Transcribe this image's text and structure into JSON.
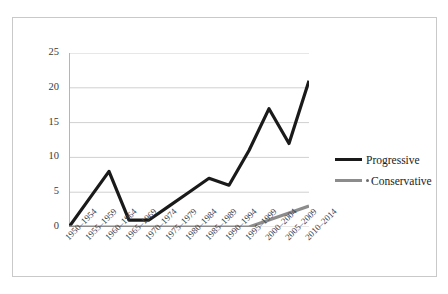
{
  "chart_data": {
    "type": "line",
    "title": "",
    "xlabel": "",
    "ylabel": "",
    "ylim": [
      0,
      25
    ],
    "yticks": [
      0,
      5,
      10,
      15,
      20,
      25
    ],
    "grid": "horizontal",
    "legend_position": "right",
    "categories": [
      "1950–1954",
      "1955–1959",
      "1960–1964",
      "1965–1969",
      "1970–1974",
      "1975–1979",
      "1980–1984",
      "1985–1989",
      "1990–1994",
      "1995–1999",
      "2000–2004",
      "2005–2009",
      "2010–2014"
    ],
    "series": [
      {
        "name": "Progressive",
        "color": "#1a1a1a",
        "style": "solid",
        "values": [
          0,
          4,
          8,
          1,
          1,
          3,
          5,
          7,
          6,
          11,
          17,
          12,
          21
        ]
      },
      {
        "name": "Conservative",
        "color": "#8c8c8c",
        "style": "solid",
        "values": [
          0,
          0,
          0,
          0,
          0,
          0,
          0,
          0,
          0,
          0,
          1,
          2,
          3
        ]
      }
    ]
  },
  "legend": {
    "items": [
      {
        "label": "Progressive",
        "color": "#1a1a1a",
        "dot": false
      },
      {
        "label": "Conservative",
        "color": "#8c8c8c",
        "dot": true
      }
    ]
  }
}
